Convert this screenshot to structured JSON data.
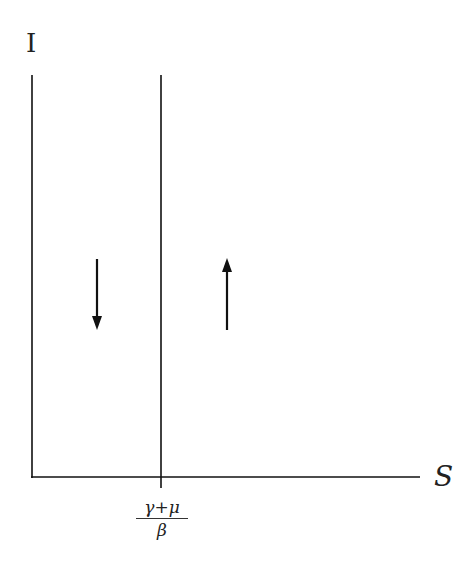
{
  "diagram": {
    "type": "phase-plane nullcline diagram",
    "y_axis_label": "I",
    "x_axis_label": "S",
    "nullcline": {
      "label_numerator": "γ+μ",
      "label_denominator": "β",
      "description": "vertical line at S = (γ+μ)/β"
    },
    "arrows": [
      {
        "region": "left of nullcline",
        "direction": "down"
      },
      {
        "region": "right of nullcline",
        "direction": "up"
      }
    ],
    "colors": {
      "line": "#111111",
      "background": "#ffffff"
    }
  }
}
